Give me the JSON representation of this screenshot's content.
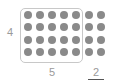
{
  "diagram": {
    "grid": {
      "rows": 4,
      "columns": 7,
      "boxed_columns": 5,
      "extra_columns": 2
    },
    "labels": {
      "rows": "4",
      "boxed_columns": "5",
      "extra_columns": "2"
    },
    "colors": {
      "dot": "#8a8a8a",
      "box_border": "#c8c8c8",
      "label": "#9a9a9a",
      "underline": "#555555"
    }
  }
}
